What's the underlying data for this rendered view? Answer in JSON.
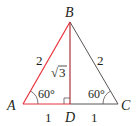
{
  "diagram": {
    "type": "triangle",
    "colors": {
      "highlight": "#e8323c",
      "line": "#5a5456",
      "text": "#231f20"
    },
    "vertices": {
      "A": "A",
      "B": "B",
      "C": "C",
      "D": "D"
    },
    "sides": {
      "AB": "2",
      "BC": "2",
      "AD": "1",
      "DC": "1",
      "BD_radical": "√",
      "BD_radicand": "3"
    },
    "angles": {
      "A": "60°",
      "C": "60°"
    }
  }
}
